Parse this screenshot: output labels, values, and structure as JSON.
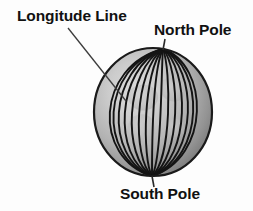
{
  "diagram": {
    "background_color": "#fdfdfd",
    "labels": {
      "longitude_line": "Longitude Line",
      "north_pole": "North Pole",
      "south_pole": "South Pole"
    },
    "globe": {
      "center_x": 153,
      "center_y": 112,
      "radius_x": 59,
      "radius_y": 64,
      "north_pole_x": 163,
      "north_pole_y": 49,
      "south_pole_x": 152,
      "south_pole_y": 176,
      "meridian_count": 15,
      "outline_color": "#1a1a1a",
      "meridian_color": "#141414",
      "shade_light": "#d8d8d8",
      "shade_mid": "#a8a8a8",
      "shade_dark": "#7a7a7a",
      "landmass_color": "#c2c2c2"
    },
    "leaders": {
      "longitude_leader": {
        "x1": 68,
        "y1": 28,
        "x2": 126,
        "y2": 101,
        "color": "#3c3c3c"
      },
      "north_pole_leader": {
        "x1": 165,
        "y1": 39,
        "x2": 163,
        "y2": 50,
        "color": "#2a2a2a"
      },
      "south_pole_leader": {
        "x1": 152,
        "y1": 176,
        "x2": 154,
        "y2": 187,
        "color": "#2a2a2a"
      }
    }
  }
}
